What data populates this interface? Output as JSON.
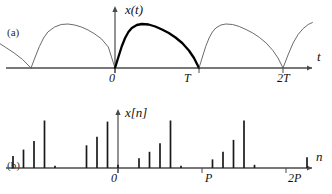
{
  "figure": {
    "panels": [
      {
        "id": "a",
        "label": "(a)",
        "signal_label": "x(t)",
        "horizontal_axis_label": "t",
        "origin_label": "0",
        "tick_labels": [
          "T",
          "2T"
        ]
      },
      {
        "id": "b",
        "label": "(b)",
        "signal_label": "x[n]",
        "horizontal_axis_label": "n",
        "origin_label": "0",
        "tick_labels": [
          "P",
          "2P"
        ]
      }
    ]
  },
  "colors": {
    "axis": "#4a4a4a",
    "curve_light": "#5a5a5a",
    "curve_bold": "#000000",
    "stem": "#1a1a1a",
    "text": "#111111"
  },
  "chart_data": [
    {
      "type": "line",
      "title": "",
      "panel": "a",
      "xlabel": "t",
      "ylabel": "x(t)",
      "grid": false,
      "legend": null,
      "xlim": [
        -1.5,
        2.35
      ],
      "ylim": [
        0,
        1.15
      ],
      "x_tick_values": [
        0,
        1,
        2
      ],
      "x_tick_labels": [
        "0",
        "T",
        "2T"
      ],
      "period": 1,
      "description": "Periodic continuous-time sawtooth-like waveform; each period rises rapidly to a rounded peak then decays to zero. One period from 0 to T is drawn with a heavy stroke.",
      "emphasized_interval": [
        0,
        1
      ],
      "series": [
        {
          "name": "x(t)",
          "x": [
            -1.5,
            -1.4,
            -1.3,
            -1.2,
            -1.1,
            -1.0,
            -0.95,
            -0.9,
            -0.85,
            -0.8,
            -0.72,
            -0.64,
            -0.56,
            -0.48,
            -0.4,
            -0.32,
            -0.24,
            -0.16,
            -0.08,
            0.0,
            0.04,
            0.08,
            0.12,
            0.16,
            0.2,
            0.26,
            0.32,
            0.4,
            0.48,
            0.56,
            0.64,
            0.72,
            0.8,
            0.88,
            0.94,
            1.0,
            1.04,
            1.08,
            1.12,
            1.16,
            1.2,
            1.26,
            1.32,
            1.4,
            1.48,
            1.56,
            1.64,
            1.72,
            1.8,
            1.88,
            1.94,
            2.0,
            2.06,
            2.12,
            2.18,
            2.24,
            2.3,
            2.35
          ],
          "y": [
            0.62,
            0.52,
            0.41,
            0.3,
            0.17,
            0.0,
            0.22,
            0.43,
            0.6,
            0.72,
            0.82,
            0.87,
            0.88,
            0.86,
            0.82,
            0.76,
            0.68,
            0.58,
            0.42,
            0.0,
            0.22,
            0.43,
            0.6,
            0.72,
            0.8,
            0.86,
            0.88,
            0.87,
            0.83,
            0.77,
            0.7,
            0.61,
            0.5,
            0.35,
            0.2,
            0.0,
            0.22,
            0.43,
            0.6,
            0.72,
            0.8,
            0.86,
            0.88,
            0.87,
            0.83,
            0.77,
            0.7,
            0.61,
            0.5,
            0.35,
            0.2,
            0.0,
            0.26,
            0.5,
            0.67,
            0.79,
            0.87,
            0.91
          ]
        }
      ]
    },
    {
      "type": "stem",
      "title": "",
      "panel": "b",
      "xlabel": "n",
      "ylabel": "x[n]",
      "grid": false,
      "legend": null,
      "ylim": [
        0,
        1.15
      ],
      "x_tick_values": [
        0,
        8,
        16
      ],
      "x_tick_labels": [
        "0",
        "P",
        "2P"
      ],
      "period_samples": 8,
      "description": "Discrete-time samples of the periodic waveform in panel (a); eight samples per period P, repeating the same envelope pattern.",
      "n": [
        -12,
        -11,
        -10,
        -9,
        -8,
        -7,
        -6,
        -5,
        -4,
        -3,
        -2,
        -1,
        0,
        1,
        2,
        3,
        4,
        5,
        6,
        7,
        8,
        9,
        10,
        11,
        12,
        13,
        14,
        15,
        16,
        17,
        18
      ],
      "values": [
        0.86,
        0.08,
        0.22,
        0.34,
        0.5,
        0.88,
        0.04,
        0.0,
        0.0,
        0.42,
        0.58,
        0.86,
        0.06,
        0.0,
        0.18,
        0.3,
        0.46,
        0.88,
        0.04,
        0.0,
        0.0,
        0.16,
        0.3,
        0.52,
        0.88,
        0.06,
        0.0,
        0.0,
        0.0,
        0.0,
        0.2
      ]
    }
  ]
}
